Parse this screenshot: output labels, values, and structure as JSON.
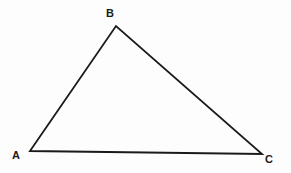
{
  "figure": {
    "kind": "geometry-diagram",
    "shape": "triangle",
    "background_color": "#fdfdfd",
    "stroke_color": "#1a1a1a",
    "stroke_width": 1.8,
    "label_color": "#1a1a1a",
    "canvas": {
      "width": 291,
      "height": 173
    },
    "vertices": [
      {
        "id": "A",
        "label": "A",
        "x": 30,
        "y": 151,
        "label_x": 12,
        "label_y": 150
      },
      {
        "id": "B",
        "label": "B",
        "x": 116,
        "y": 26,
        "label_x": 106,
        "label_y": 8
      },
      {
        "id": "C",
        "label": "C",
        "x": 262,
        "y": 154,
        "label_x": 265,
        "label_y": 154
      }
    ],
    "edges": [
      {
        "id": "AB",
        "from": "A",
        "to": "B"
      },
      {
        "id": "BC",
        "from": "B",
        "to": "C"
      },
      {
        "id": "CA",
        "from": "C",
        "to": "A"
      }
    ],
    "polygon_points": "30,151 116,26 262,154"
  }
}
